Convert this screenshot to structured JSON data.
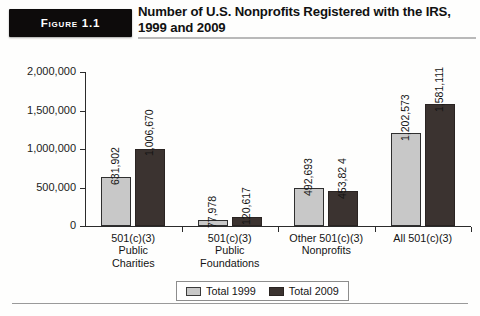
{
  "header": {
    "figure_badge": "Figure 1.1",
    "title": "Number of U.S. Nonprofits Registered with the IRS, 1999 and 2009"
  },
  "legend": {
    "items": [
      {
        "label": "Total 1999",
        "color": "#c8c8c8",
        "swatch": "legend-swatch-1999"
      },
      {
        "label": "Total 2009",
        "color": "#3b3330",
        "swatch": "legend-swatch-2009"
      }
    ]
  },
  "chart_data": {
    "type": "bar",
    "title": "Number of U.S. Nonprofits Registered with the IRS, 1999 and 2009",
    "xlabel": "",
    "ylabel": "",
    "ylim": [
      0,
      2000000
    ],
    "grid": false,
    "legend_position": "bottom-center",
    "ytick_labels": [
      "2,000,000",
      "1,500,000",
      "1,000,000",
      "500,000",
      "0"
    ],
    "ytick_values": [
      2000000,
      1500000,
      1000000,
      500000,
      0
    ],
    "categories": [
      "501(c)(3) Public Charities",
      "501(c)(3) Public Foundations",
      "Other 501(c)(3) Nonprofits",
      "All 501(c)(3)"
    ],
    "category_lines": [
      [
        "501(c)(3)",
        "Public",
        "Charities"
      ],
      [
        "501(c)(3)",
        "Public",
        "Foundations"
      ],
      [
        "Other 501(c)(3)",
        "Nonprofits"
      ],
      [
        "All 501(c)(3)"
      ]
    ],
    "series": [
      {
        "name": "Total 1999",
        "color": "#c8c8c8",
        "values": [
          631902,
          77978,
          492693,
          1202573
        ],
        "labels": [
          "631,902",
          "77,978",
          "492,693",
          "1,202,573"
        ]
      },
      {
        "name": "Total 2009",
        "color": "#3b3330",
        "values": [
          1006670,
          120617,
          453824,
          1581111
        ],
        "labels": [
          "1,006,670",
          "120,617",
          "453,82 4",
          "1,581,111"
        ]
      }
    ]
  }
}
